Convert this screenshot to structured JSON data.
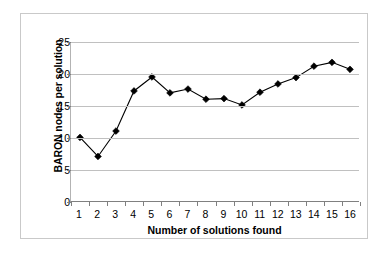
{
  "chart_data": {
    "type": "line",
    "title": "",
    "xlabel": "Number of solutions found",
    "ylabel": "BARON nodes per solution",
    "categories": [
      "1",
      "2",
      "3",
      "4",
      "5",
      "6",
      "7",
      "8",
      "9",
      "10",
      "11",
      "12",
      "13",
      "14",
      "15",
      "16"
    ],
    "x": [
      1,
      2,
      3,
      4,
      5,
      6,
      7,
      8,
      9,
      10,
      11,
      12,
      13,
      14,
      15,
      16
    ],
    "values": [
      10.0,
      7.0,
      11.0,
      17.3,
      19.5,
      17.0,
      17.6,
      16.0,
      16.1,
      15.1,
      17.1,
      18.4,
      19.4,
      21.2,
      21.8,
      20.7
    ],
    "series": [
      {
        "name": "BARON nodes per solution",
        "values": [
          10.0,
          7.0,
          11.0,
          17.3,
          19.5,
          17.0,
          17.6,
          16.0,
          16.1,
          15.1,
          17.1,
          18.4,
          19.4,
          21.2,
          21.8,
          20.7
        ],
        "marker": "diamond",
        "marker_color": "#000000",
        "line_color": "#000000"
      }
    ],
    "ylim": [
      0,
      25
    ],
    "ytick_labels": [
      "25",
      "20",
      "15",
      "10",
      "5",
      "0"
    ],
    "yticks": [
      25,
      20,
      15,
      10,
      5,
      0
    ],
    "grid": "horizontal",
    "gridline_color": "#c0c0c0",
    "legend": "none",
    "legend_position": "none",
    "plot_background": "#ffffff",
    "frame_color": "#c9c9c9",
    "axis_color": "#808080"
  }
}
